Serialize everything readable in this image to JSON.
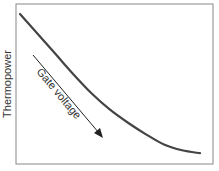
{
  "chart_data": {
    "type": "line",
    "title": "",
    "xlabel": "",
    "ylabel": "Thermopower",
    "xlim": [
      0,
      1
    ],
    "ylim": [
      0,
      1
    ],
    "grid": false,
    "ticks": false,
    "series": [
      {
        "name": "thermopower",
        "color": "#444444",
        "x": [
          0.0,
          0.1,
          0.2,
          0.3,
          0.4,
          0.5,
          0.6,
          0.7,
          0.8,
          0.9,
          1.0
        ],
        "y": [
          1.0,
          0.86,
          0.72,
          0.58,
          0.45,
          0.34,
          0.25,
          0.17,
          0.1,
          0.06,
          0.04
        ]
      }
    ],
    "annotations": [
      {
        "type": "arrow",
        "text": "Gate voltage",
        "direction": "increasing",
        "color": "#222222"
      }
    ]
  }
}
